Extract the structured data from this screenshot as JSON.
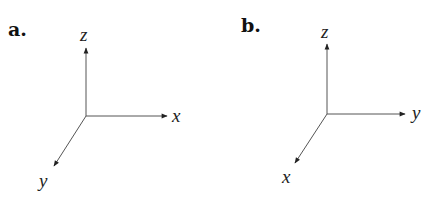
{
  "panels": [
    {
      "label": "a.",
      "axes": {
        "up": "z",
        "right": "x",
        "diagonal": "y"
      }
    },
    {
      "label": "b.",
      "axes": {
        "up": "z",
        "right": "y",
        "diagonal": "x"
      }
    }
  ],
  "colors": {
    "line": "#444444",
    "text": "#222222"
  }
}
